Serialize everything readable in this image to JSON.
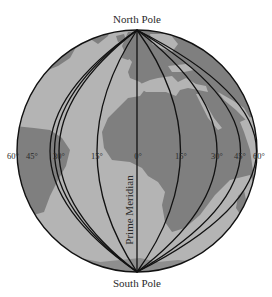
{
  "figure": {
    "type": "globe-diagram",
    "labels": {
      "north_pole": "North Pole",
      "south_pole": "South Pole",
      "prime_meridian": "Prime Meridian"
    },
    "longitude_labels": [
      {
        "id": "w60",
        "text": "60°"
      },
      {
        "id": "w45",
        "text": "45°"
      },
      {
        "id": "w30",
        "text": "30°"
      },
      {
        "id": "w15",
        "text": "15°"
      },
      {
        "id": "m0",
        "text": "0°"
      },
      {
        "id": "e15",
        "text": "15°"
      },
      {
        "id": "e30",
        "text": "30°"
      },
      {
        "id": "e45",
        "text": "45°"
      },
      {
        "id": "e60",
        "text": "60°"
      }
    ],
    "colors": {
      "ocean": "#b4b4b4",
      "land": "#7f7f7f",
      "meridian_line": "#111111",
      "outline": "#111111",
      "label_text": "#2a2a2a",
      "background": "#ffffff"
    }
  }
}
